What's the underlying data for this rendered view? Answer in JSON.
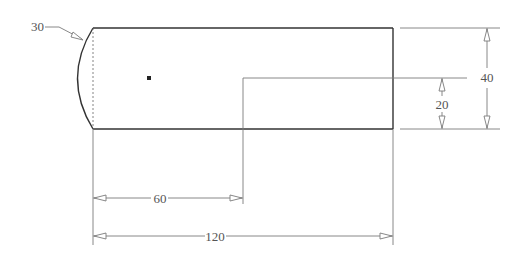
{
  "drawing": {
    "type": "technical-drawing",
    "colors": {
      "outline": "#333333",
      "dimension": "#7a7a7a",
      "text": "#555555",
      "background": "#ffffff"
    },
    "dimensions": {
      "radius": {
        "label": "30",
        "kind": "arc-leader"
      },
      "overall_height": {
        "label": "40",
        "kind": "vertical"
      },
      "step_height": {
        "label": "20",
        "kind": "vertical"
      },
      "step_length": {
        "label": "60",
        "kind": "horizontal"
      },
      "overall_length": {
        "label": "120",
        "kind": "horizontal"
      }
    },
    "features": {
      "body": "rectangle with curved left end",
      "center_point": "small filled square marker",
      "step": "step line at half height starting at 60"
    }
  }
}
